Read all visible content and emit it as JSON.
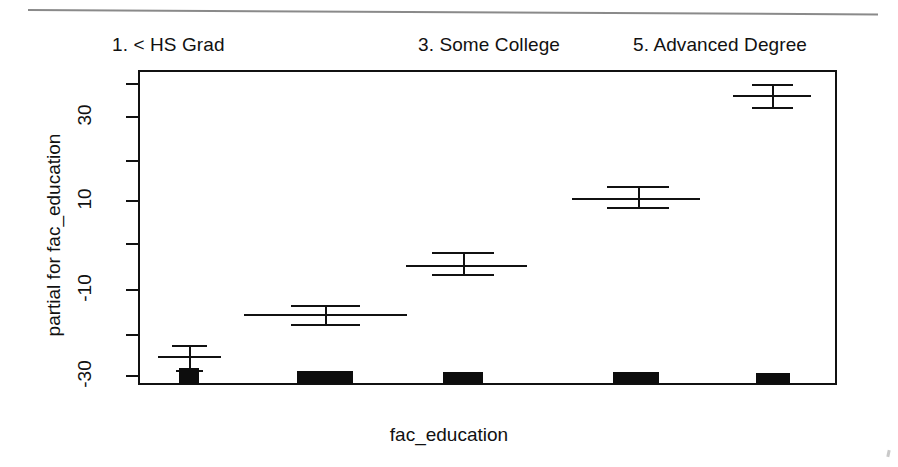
{
  "figure": {
    "x_axis_title": "fac_education",
    "y_axis_title": "partial for fac_education"
  },
  "strip_labels": [
    {
      "text": "1. < HS Grad",
      "x": 112
    },
    {
      "text": "3. Some College",
      "x": 418
    },
    {
      "text": "5. Advanced Degree",
      "x": 633
    }
  ],
  "y_ticks": [
    {
      "label": "",
      "y": 83
    },
    {
      "label": "30",
      "y": 116
    },
    {
      "label": "",
      "y": 160
    },
    {
      "label": "10",
      "y": 200
    },
    {
      "label": "",
      "y": 243
    },
    {
      "label": "-10",
      "y": 289
    },
    {
      "label": "",
      "y": 334
    },
    {
      "label": "-30",
      "y": 375
    }
  ],
  "chart_data": {
    "type": "line",
    "plot_kind": "partial-residual effect plot with 95% confidence intervals",
    "title": "",
    "xlabel": "fac_education",
    "ylabel": "partial for fac_education",
    "categories": [
      "1. < HS Grad",
      "2. HS Grad",
      "3. Some College",
      "4. College Degree",
      "5. Advanced Degree"
    ],
    "category_labels_shown": [
      "1. < HS Grad",
      "3. Some College",
      "5. Advanced Degree"
    ],
    "ylim": [
      -36,
      40
    ],
    "ytick_values": [
      -30,
      -10,
      10,
      30
    ],
    "yminor_tick_values": [
      -40,
      -20,
      0,
      20,
      40
    ],
    "grid": false,
    "legend": null,
    "series": [
      {
        "name": "partial effect",
        "values": [
          -25.0,
          -16.0,
          -3.5,
          11.5,
          37.0
        ],
        "ci_lower": [
          -29.5,
          -17.5,
          -5.5,
          9.5,
          34.5
        ],
        "ci_upper": [
          -21.5,
          -14.5,
          -1.5,
          13.5,
          39.5
        ]
      }
    ],
    "rug_histogram": {
      "note": "black frequency blocks along the bottom axis, width proportional to count",
      "relative_widths": [
        20,
        56,
        40,
        46,
        34
      ]
    }
  },
  "marks": [
    {
      "name": "group-1",
      "center_x": 189,
      "est_y": 356,
      "est_x1": 158,
      "est_x2": 221,
      "upper_y": 345,
      "upper_x1": 172,
      "upper_x2": 207,
      "lower_y": 370,
      "lower_x1": 176,
      "lower_x2": 203,
      "rug_x": 179,
      "rug_w": 20,
      "rug_h": 16
    },
    {
      "name": "group-2",
      "center_x": 325,
      "est_y": 314,
      "est_x1": 244,
      "est_x2": 407,
      "upper_y": 305,
      "upper_x1": 291,
      "upper_x2": 360,
      "lower_y": 324,
      "lower_x1": 291,
      "lower_x2": 360,
      "rug_x": 297,
      "rug_w": 56,
      "rug_h": 13
    },
    {
      "name": "group-3",
      "center_x": 463,
      "est_y": 265,
      "est_x1": 406,
      "est_x2": 527,
      "upper_y": 252,
      "upper_x1": 432,
      "upper_x2": 494,
      "lower_y": 274,
      "lower_x1": 432,
      "lower_x2": 494,
      "rug_x": 443,
      "rug_w": 40,
      "rug_h": 12
    },
    {
      "name": "group-4",
      "center_x": 638,
      "est_y": 198,
      "est_x1": 572,
      "est_x2": 700,
      "upper_y": 186,
      "upper_x1": 607,
      "upper_x2": 669,
      "lower_y": 207,
      "lower_x1": 607,
      "lower_x2": 669,
      "rug_x": 613,
      "rug_w": 46,
      "rug_h": 12
    },
    {
      "name": "group-5",
      "center_x": 772,
      "est_y": 95,
      "est_x1": 733,
      "est_x2": 811,
      "upper_y": 84,
      "upper_x1": 752,
      "upper_x2": 793,
      "lower_y": 107,
      "lower_x1": 752,
      "lower_x2": 793,
      "rug_x": 756,
      "rug_w": 34,
      "rug_h": 11
    }
  ]
}
